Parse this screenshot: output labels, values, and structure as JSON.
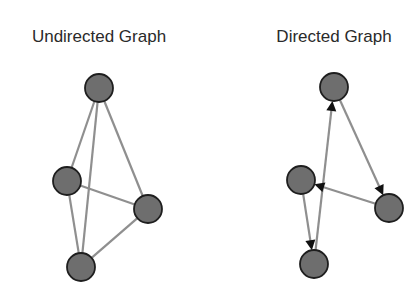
{
  "diagrams": [
    {
      "id": "undirected",
      "title": "Undirected Graph",
      "title_pos": [
        99,
        42
      ],
      "directed": false,
      "node_radius": 14,
      "nodes": [
        {
          "id": "top",
          "x": 99,
          "y": 88
        },
        {
          "id": "left",
          "x": 67,
          "y": 181
        },
        {
          "id": "right",
          "x": 148,
          "y": 209
        },
        {
          "id": "bottom",
          "x": 81,
          "y": 267
        }
      ],
      "edges": [
        {
          "from": "top",
          "to": "left"
        },
        {
          "from": "top",
          "to": "bottom"
        },
        {
          "from": "top",
          "to": "right"
        },
        {
          "from": "left",
          "to": "right"
        },
        {
          "from": "left",
          "to": "bottom"
        },
        {
          "from": "right",
          "to": "bottom"
        }
      ]
    },
    {
      "id": "directed",
      "title": "Directed Graph",
      "title_pos": [
        334,
        42
      ],
      "directed": true,
      "node_radius": 14,
      "nodes": [
        {
          "id": "top",
          "x": 334,
          "y": 87
        },
        {
          "id": "left",
          "x": 301,
          "y": 180
        },
        {
          "id": "right",
          "x": 389,
          "y": 208
        },
        {
          "id": "bottom",
          "x": 314,
          "y": 264
        }
      ],
      "edges": [
        {
          "from": "bottom",
          "to": "top"
        },
        {
          "from": "top",
          "to": "right"
        },
        {
          "from": "right",
          "to": "left"
        },
        {
          "from": "left",
          "to": "bottom"
        }
      ]
    }
  ],
  "colors": {
    "node_fill": "#6e6e6e",
    "node_stroke": "#1e1e1e",
    "edge": "#8f8f8f",
    "arrowhead": "#111111",
    "title": "#2a2a2a",
    "background": "#ffffff"
  }
}
